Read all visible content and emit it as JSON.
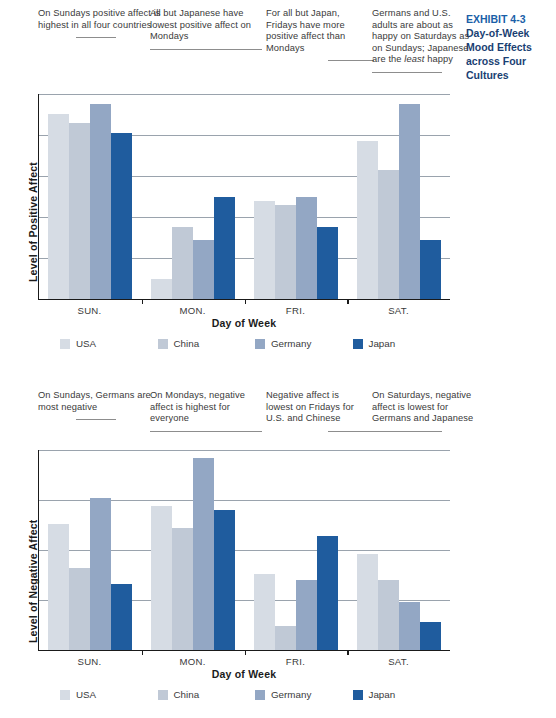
{
  "exhibit": {
    "number": "EXHIBIT 4-3",
    "title_line1": "Day-of-Week",
    "title_line2": "Mood Effects",
    "title_line3": "across Four",
    "title_line4": "Cultures"
  },
  "colors": {
    "usa": "#d6dce4",
    "china": "#c0c9d6",
    "germany": "#93a7c4",
    "japan": "#1f5c9e",
    "gridline": "#9aa3ad",
    "axis": "#1a1a1a",
    "accent": "#1a3f73"
  },
  "chart1": {
    "annotations": [
      "On Sundays positive affect is highest in all four countries",
      "All but Japanese have lowest positive affect on Mondays",
      "For all but Japan, Fridays have more positive affect than Mondays",
      "Germans and U.S. adults are about as happy on Saturdays as on Sundays; Japanese are the least happy"
    ],
    "annotation_italic_word": "least"
  },
  "chart2": {
    "annotations": [
      "On Sundays, Germans are most negative",
      "On Mondays, negative affect is highest for everyone",
      "Negative affect is lowest on Fridays for U.S. and Chinese",
      "On Saturdays, negative affect is lowest for Germans and Japanese"
    ]
  },
  "legend": {
    "items": [
      {
        "label": "USA",
        "color": "#d6dce4"
      },
      {
        "label": "China",
        "color": "#c0c9d6"
      },
      {
        "label": "Germany",
        "color": "#93a7c4"
      },
      {
        "label": "Japan",
        "color": "#1f5c9e"
      }
    ]
  },
  "chart_data": [
    {
      "type": "bar",
      "title": "Day-of-Week Mood Effects across Four Cultures (Positive Affect)",
      "xlabel": "Day of Week",
      "ylabel": "Level of Positive Affect",
      "categories": [
        "SUN.",
        "MON.",
        "FRI.",
        "SAT."
      ],
      "series": [
        {
          "name": "USA",
          "color": "#d6dce4",
          "values": [
            95,
            10,
            50,
            81
          ]
        },
        {
          "name": "China",
          "color": "#c0c9d6",
          "values": [
            90,
            37,
            48,
            66
          ]
        },
        {
          "name": "Germany",
          "color": "#93a7c4",
          "values": [
            100,
            30,
            52,
            100
          ]
        },
        {
          "name": "Japan",
          "color": "#1f5c9e",
          "values": [
            85,
            52,
            37,
            30
          ]
        }
      ],
      "ylim": [
        0,
        105
      ],
      "yticks": [
        0,
        21,
        42,
        63,
        84,
        105
      ],
      "ytick_labels": [],
      "grid": true,
      "legend_position": "bottom"
    },
    {
      "type": "bar",
      "title": "Day-of-Week Mood Effects across Four Cultures (Negative Affect)",
      "xlabel": "Day of Week",
      "ylabel": "Level of Negative Affect",
      "categories": [
        "SUN.",
        "MON.",
        "FRI.",
        "SAT."
      ],
      "series": [
        {
          "name": "USA",
          "color": "#d6dce4",
          "values": [
            63,
            72,
            38,
            48
          ]
        },
        {
          "name": "China",
          "color": "#c0c9d6",
          "values": [
            41,
            61,
            12,
            35
          ]
        },
        {
          "name": "Germany",
          "color": "#93a7c4",
          "values": [
            76,
            96,
            35,
            24
          ]
        },
        {
          "name": "Japan",
          "color": "#1f5c9e",
          "values": [
            33,
            70,
            57,
            14
          ]
        }
      ],
      "ylim": [
        0,
        100
      ],
      "yticks": [
        0,
        25,
        50,
        75,
        100
      ],
      "ytick_labels": [],
      "grid": true,
      "legend_position": "bottom"
    }
  ],
  "axis": {
    "xlabel": "Day of Week",
    "ylabel1": "Level of Positive Affect",
    "ylabel2": "Level of Negative Affect",
    "categories": [
      "SUN.",
      "MON.",
      "FRI.",
      "SAT."
    ]
  }
}
